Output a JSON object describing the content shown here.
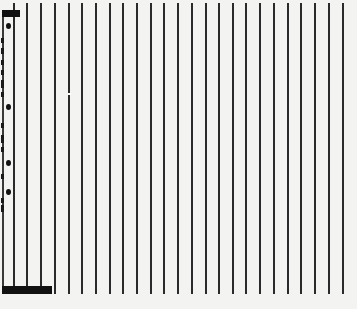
{
  "pattern": {
    "background": "#f3f3f1",
    "line_color": "#2a2a2a",
    "line_top": 3,
    "line_bottom": 294,
    "line_width": 2,
    "line_positions": [
      14,
      27,
      41,
      55,
      69,
      82,
      96,
      110,
      123,
      137,
      151,
      164,
      178,
      192,
      206,
      219,
      233,
      246,
      260,
      274,
      288,
      301,
      315,
      329,
      343
    ]
  },
  "markers": {
    "top_bar": {
      "x": 2,
      "y": 10,
      "w": 18,
      "h": 7
    },
    "bottom_bar": {
      "x": 2,
      "y": 286,
      "w": 50,
      "h": 8
    },
    "dots": [
      {
        "x": 6,
        "y": 23
      },
      {
        "x": 6,
        "y": 104
      },
      {
        "x": 6,
        "y": 160
      },
      {
        "x": 6,
        "y": 189
      }
    ],
    "dashes": [
      {
        "y": 38,
        "h": 5
      },
      {
        "y": 48,
        "h": 6
      },
      {
        "y": 60,
        "h": 5
      },
      {
        "y": 70,
        "h": 5
      },
      {
        "y": 80,
        "h": 8
      },
      {
        "y": 92,
        "h": 5
      },
      {
        "y": 123,
        "h": 5
      },
      {
        "y": 135,
        "h": 8
      },
      {
        "y": 147,
        "h": 5
      },
      {
        "y": 174,
        "h": 5
      },
      {
        "y": 198,
        "h": 5
      },
      {
        "y": 205,
        "h": 7
      }
    ],
    "specks": [
      {
        "x": 68,
        "y": 93
      }
    ]
  }
}
